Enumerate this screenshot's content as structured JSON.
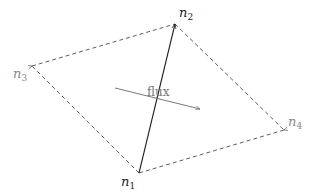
{
  "diagram": {
    "title": "",
    "nodes": [
      {
        "id": "n1",
        "label": "n",
        "sub": "1",
        "x": 139,
        "y": 173,
        "label_x": 121,
        "label_y": 186,
        "color": "#222222"
      },
      {
        "id": "n2",
        "label": "n",
        "sub": "2",
        "x": 175,
        "y": 24,
        "label_x": 179,
        "label_y": 17,
        "color": "#222222"
      },
      {
        "id": "n3",
        "label": "n",
        "sub": "3",
        "x": 32,
        "y": 66,
        "label_x": 13,
        "label_y": 78,
        "color": "#888888"
      },
      {
        "id": "n4",
        "label": "n",
        "sub": "4",
        "x": 284,
        "y": 130,
        "label_x": 288,
        "label_y": 126,
        "color": "#888888"
      }
    ],
    "solid_edge": {
      "from": "n1",
      "to": "n2",
      "color": "#222222"
    },
    "dashed_edges": [
      {
        "from": "n2",
        "to": "n4"
      },
      {
        "from": "n4",
        "to": "n1"
      },
      {
        "from": "n1",
        "to": "n3"
      },
      {
        "from": "n3",
        "to": "n2"
      }
    ],
    "flux_arrow": {
      "label": "flux",
      "x1": 115,
      "y1": 88,
      "x2": 200,
      "y2": 109,
      "color": "#777777",
      "label_x": 147,
      "label_y": 96
    }
  }
}
